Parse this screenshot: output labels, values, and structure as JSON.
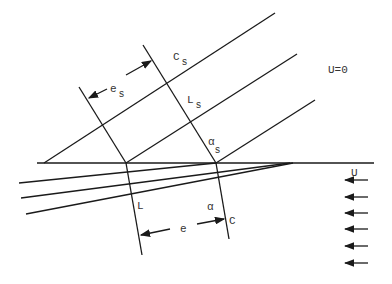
{
  "diagram": {
    "type": "characteristic-lines / shock reflection sketch",
    "labels": {
      "C_s": {
        "main": "C",
        "sub": "s"
      },
      "e_s": {
        "main": "e",
        "sub": "s"
      },
      "L_s": {
        "main": "L",
        "sub": "s"
      },
      "alpha_s": {
        "main": "α",
        "sub": "s"
      },
      "U0": "U=0",
      "U": "U",
      "L": "L",
      "e": "e",
      "alpha": "α",
      "C": "C"
    },
    "flow_arrows_count": 6,
    "colors": {
      "line": "#1a1a1a",
      "text": "#333333",
      "background": "#ffffff"
    }
  }
}
